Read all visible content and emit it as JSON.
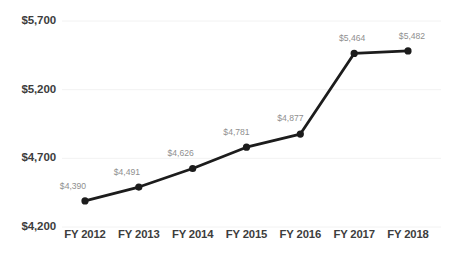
{
  "chart_data": {
    "type": "line",
    "title": "",
    "xlabel": "",
    "ylabel": "",
    "categories": [
      "FY 2012",
      "FY 2013",
      "FY 2014",
      "FY 2015",
      "FY 2016",
      "FY 2017",
      "FY 2018"
    ],
    "values": [
      4390,
      4491,
      4626,
      4781,
      4877,
      5464,
      5482
    ],
    "point_labels": [
      "$4,390",
      "$4,491",
      "$4,626",
      "$4,781",
      "$4,877",
      "$5,464",
      "$5,482"
    ],
    "ylim": [
      4200,
      5700
    ],
    "yticks": [
      4200,
      4700,
      5200,
      5700
    ],
    "ytick_labels": [
      "$4,200",
      "$4,700",
      "$5,200",
      "$5,700"
    ],
    "grid": true,
    "legend": "none",
    "series": [
      {
        "name": "Value",
        "values": [
          4390,
          4491,
          4626,
          4781,
          4877,
          5464,
          5482
        ]
      }
    ],
    "colors": {
      "line": "#1c1c1c",
      "marker": "#1c1c1c",
      "grid": "#f2f2f2",
      "axis_text": "#3d3d3d",
      "label_text": "#8f8f8f",
      "background": "#ffffff"
    }
  }
}
